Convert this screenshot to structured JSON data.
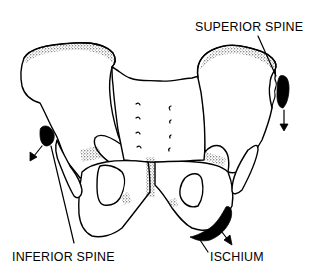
{
  "diagram": {
    "labels": {
      "superior_spine": "SUPERIOR SPINE",
      "inferior_spine": "INFERIOR SPINE",
      "ischium": "ISCHIUM"
    },
    "colors": {
      "ink": "#000000",
      "background": "#ffffff"
    }
  }
}
